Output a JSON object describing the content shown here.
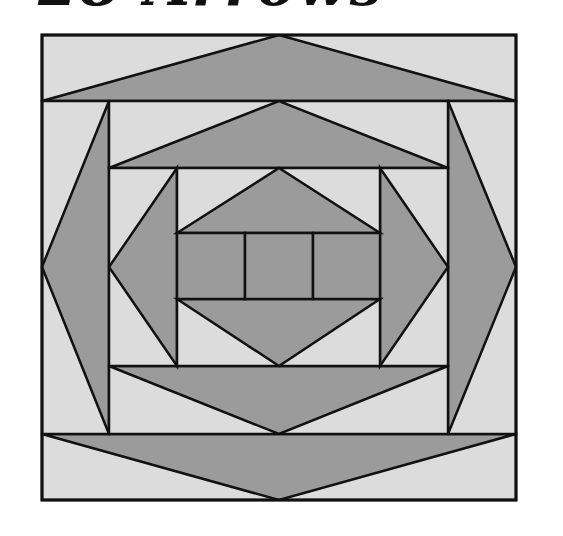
{
  "title": "28 Arrows",
  "colors": {
    "background": "#ffffff",
    "light": "#dcdcdc",
    "dark": "#9b9b9b",
    "stroke": "#111111"
  },
  "diagram": {
    "outer": {
      "x1": 42,
      "y1": 35,
      "x2": 516,
      "y2": 500
    },
    "top_band": {
      "rect": [
        42,
        35,
        516,
        101
      ],
      "arrow": [
        [
          42,
          101
        ],
        [
          279,
          35
        ],
        [
          516,
          101
        ]
      ],
      "direction": "up"
    },
    "bottom_band": {
      "rect": [
        42,
        434,
        516,
        500
      ],
      "arrow": [
        [
          42,
          434
        ],
        [
          279,
          500
        ],
        [
          516,
          434
        ]
      ],
      "direction": "down"
    },
    "left_band": {
      "rect": [
        42,
        101,
        109,
        434
      ],
      "arrow": [
        [
          109,
          101
        ],
        [
          42,
          267
        ],
        [
          109,
          434
        ]
      ],
      "direction": "left"
    },
    "right_band": {
      "rect": [
        448,
        101,
        516,
        434
      ],
      "arrow": [
        [
          448,
          101
        ],
        [
          516,
          267
        ],
        [
          448,
          434
        ]
      ],
      "direction": "right"
    },
    "inner_top_band": {
      "rect": [
        109,
        101,
        448,
        168
      ],
      "arrow": [
        [
          109,
          168
        ],
        [
          279,
          101
        ],
        [
          448,
          168
        ]
      ],
      "direction": "up"
    },
    "inner_bottom_band": {
      "rect": [
        109,
        366,
        448,
        434
      ],
      "arrow": [
        [
          109,
          366
        ],
        [
          279,
          434
        ],
        [
          448,
          366
        ]
      ],
      "direction": "down"
    },
    "inner_left_band": {
      "rect": [
        109,
        168,
        177,
        366
      ],
      "arrow": [
        [
          177,
          168
        ],
        [
          109,
          267
        ],
        [
          177,
          366
        ]
      ],
      "direction": "left"
    },
    "inner_right_band": {
      "rect": [
        380,
        168,
        448,
        366
      ],
      "arrow": [
        [
          380,
          168
        ],
        [
          448,
          267
        ],
        [
          380,
          366
        ]
      ],
      "direction": "right"
    },
    "core_top_band": {
      "rect": [
        177,
        168,
        380,
        233
      ],
      "arrow": [
        [
          177,
          233
        ],
        [
          279,
          168
        ],
        [
          380,
          233
        ]
      ],
      "direction": "up"
    },
    "core_bottom_band": {
      "rect": [
        177,
        299,
        380,
        366
      ],
      "arrow": [
        [
          177,
          299
        ],
        [
          279,
          366
        ],
        [
          380,
          299
        ]
      ],
      "direction": "down"
    },
    "center_squares": [
      [
        177,
        233,
        245,
        299
      ],
      [
        245,
        233,
        313,
        299
      ],
      [
        313,
        233,
        380,
        299
      ]
    ]
  }
}
